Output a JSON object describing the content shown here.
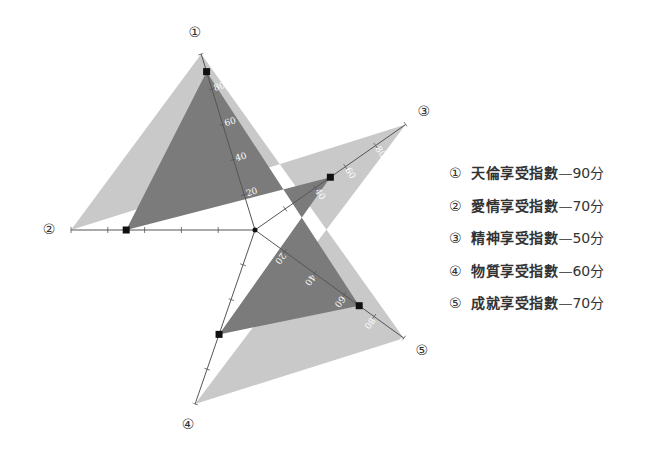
{
  "chart_data": {
    "type": "radar",
    "title": "",
    "axes": [
      {
        "id": "①",
        "name": "天倫享受指數",
        "value": 90,
        "angle_deg": 107
      },
      {
        "id": "②",
        "name": "愛情享受指數",
        "value": 70,
        "angle_deg": 180
      },
      {
        "id": "③",
        "name": "精神享受指數",
        "value": 50,
        "angle_deg": 35
      },
      {
        "id": "④",
        "name": "物質享受指數",
        "value": 60,
        "angle_deg": 251
      },
      {
        "id": "⑤",
        "name": "成就享受指數",
        "value": 70,
        "angle_deg": -36
      }
    ],
    "range": [
      0,
      100
    ],
    "ticks": [
      0,
      20,
      40,
      60,
      80,
      100
    ],
    "series": [
      {
        "name": "享受指數",
        "values": [
          90,
          70,
          50,
          60,
          70
        ]
      }
    ],
    "colors": {
      "outer": "#c9c9c9",
      "inner": "#7b7b7b",
      "axis": "#555555",
      "marker": "#111111"
    },
    "legend_position": "right",
    "grid": false
  },
  "legend": [
    {
      "num": "①",
      "label": "天倫享受指數",
      "sep": "—",
      "score": "90分"
    },
    {
      "num": "②",
      "label": "愛情享受指數",
      "sep": "—",
      "score": "70分"
    },
    {
      "num": "③",
      "label": "精神享受指數",
      "sep": "—",
      "score": "50分"
    },
    {
      "num": "④",
      "label": "物質享受指數",
      "sep": "—",
      "score": "60分"
    },
    {
      "num": "⑤",
      "label": "成就享受指數",
      "sep": "—",
      "score": "70分"
    }
  ]
}
